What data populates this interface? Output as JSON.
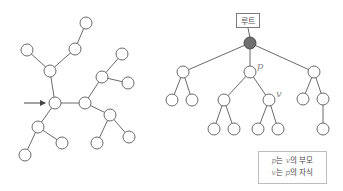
{
  "left_tree": {
    "nodes": [
      {
        "id": "A",
        "x": 55,
        "y": 103
      },
      {
        "id": "B",
        "x": 50,
        "y": 71
      },
      {
        "id": "C",
        "x": 27,
        "y": 50
      },
      {
        "id": "D",
        "x": 75,
        "y": 49
      },
      {
        "id": "E",
        "x": 86,
        "y": 23
      },
      {
        "id": "F",
        "x": 85,
        "y": 103
      },
      {
        "id": "G",
        "x": 102,
        "y": 77
      },
      {
        "id": "H",
        "x": 122,
        "y": 54
      },
      {
        "id": "I",
        "x": 128,
        "y": 83
      },
      {
        "id": "J",
        "x": 110,
        "y": 115
      },
      {
        "id": "K",
        "x": 97,
        "y": 143
      },
      {
        "id": "L",
        "x": 129,
        "y": 137
      },
      {
        "id": "M",
        "x": 38,
        "y": 127
      },
      {
        "id": "N",
        "x": 62,
        "y": 143
      },
      {
        "id": "O",
        "x": 25,
        "y": 155
      }
    ],
    "edges": [
      [
        "A",
        "B"
      ],
      [
        "B",
        "C"
      ],
      [
        "B",
        "D"
      ],
      [
        "D",
        "E"
      ],
      [
        "A",
        "F"
      ],
      [
        "F",
        "G"
      ],
      [
        "G",
        "H"
      ],
      [
        "G",
        "I"
      ],
      [
        "F",
        "J"
      ],
      [
        "J",
        "K"
      ],
      [
        "J",
        "L"
      ],
      [
        "A",
        "M"
      ],
      [
        "M",
        "N"
      ],
      [
        "M",
        "O"
      ]
    ],
    "arrow": {
      "x1": 24,
      "y1": 103,
      "x2": 45,
      "y2": 103,
      "points_to": "A"
    }
  },
  "right_tree": {
    "root_label": "루트",
    "nodes": [
      {
        "id": "root",
        "x": 250,
        "y": 43,
        "filled": true
      },
      {
        "id": "a",
        "x": 183,
        "y": 72
      },
      {
        "id": "p",
        "x": 250,
        "y": 72,
        "label": "p"
      },
      {
        "id": "c",
        "x": 314,
        "y": 72
      },
      {
        "id": "a1",
        "x": 172,
        "y": 100
      },
      {
        "id": "a2",
        "x": 192,
        "y": 100
      },
      {
        "id": "p1",
        "x": 224,
        "y": 100
      },
      {
        "id": "v",
        "x": 269,
        "y": 100,
        "label": "v"
      },
      {
        "id": "c1",
        "x": 303,
        "y": 99
      },
      {
        "id": "c2",
        "x": 323,
        "y": 99
      },
      {
        "id": "p1a",
        "x": 214,
        "y": 129
      },
      {
        "id": "p1b",
        "x": 234,
        "y": 129
      },
      {
        "id": "va",
        "x": 258,
        "y": 129
      },
      {
        "id": "vb",
        "x": 278,
        "y": 129
      },
      {
        "id": "c2a",
        "x": 323,
        "y": 129
      }
    ],
    "edges": [
      [
        "root",
        "a"
      ],
      [
        "root",
        "p"
      ],
      [
        "root",
        "c"
      ],
      [
        "a",
        "a1"
      ],
      [
        "a",
        "a2"
      ],
      [
        "p",
        "p1"
      ],
      [
        "p",
        "v"
      ],
      [
        "c",
        "c1"
      ],
      [
        "c",
        "c2"
      ],
      [
        "p1",
        "p1a"
      ],
      [
        "p1",
        "p1b"
      ],
      [
        "v",
        "va"
      ],
      [
        "v",
        "vb"
      ],
      [
        "c2",
        "c2a"
      ]
    ]
  },
  "legend": {
    "line1": {
      "var1": "p",
      "text1": "는 ",
      "var2": "v",
      "text2": "의 부모"
    },
    "line2": {
      "var1": "v",
      "text1": "는 ",
      "var2": "p",
      "text2": "의 자식"
    }
  },
  "style": {
    "node_radius": 6,
    "edge_color": "#6a6a6a",
    "root_fill": "#6f6f6f"
  }
}
